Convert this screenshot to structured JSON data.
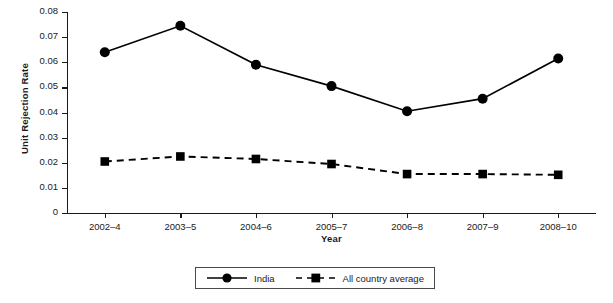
{
  "chart_data": {
    "type": "line",
    "title": "",
    "xlabel": "Year",
    "ylabel": "Unit Rejection Rate",
    "categories": [
      "2002–4",
      "2003–5",
      "2004–6",
      "2005–7",
      "2006–8",
      "2007–9",
      "2008–10"
    ],
    "ylim": [
      0,
      0.08
    ],
    "yticks": [
      0,
      0.01,
      0.02,
      0.03,
      0.04,
      0.05,
      0.06,
      0.07,
      0.08
    ],
    "ytick_labels": [
      "0",
      "0.01",
      "0.02",
      "0.03",
      "0.04",
      "0.05",
      "0.06",
      "0.07",
      "0.08"
    ],
    "grid": false,
    "legend_position": "bottom-center",
    "series": [
      {
        "name": "India",
        "values": [
          0.064,
          0.0745,
          0.059,
          0.0505,
          0.0405,
          0.0455,
          0.0615
        ],
        "line_style": "solid",
        "marker": "circle",
        "color": "#000000"
      },
      {
        "name": "All country average",
        "values": [
          0.0205,
          0.0225,
          0.0215,
          0.0195,
          0.0155,
          0.0155,
          0.0152
        ],
        "line_style": "dashed",
        "marker": "square",
        "color": "#000000"
      }
    ]
  },
  "legend": {
    "entries": [
      {
        "label": "India"
      },
      {
        "label": "All country average"
      }
    ]
  }
}
